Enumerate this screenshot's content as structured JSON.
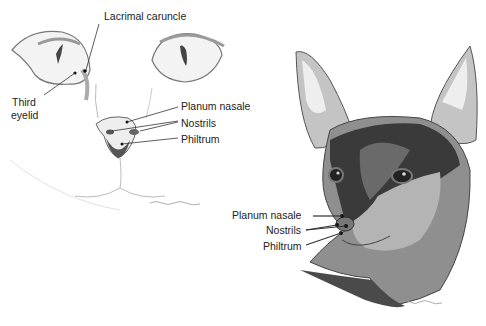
{
  "figure": {
    "cat": {
      "labels": {
        "lacrimal_caruncle": "Lacrimal caruncle",
        "third_eyelid_line1": "Third",
        "third_eyelid_line2": "eyelid",
        "planum_nasale": "Planum nasale",
        "nostrils": "Nostrils",
        "philtrum": "Philtrum"
      }
    },
    "dog": {
      "labels": {
        "planum_nasale": "Planum nasale",
        "nostrils": "Nostrils",
        "philtrum": "Philtrum"
      }
    },
    "colors": {
      "line": "#333333",
      "dog_dark": "#3a3a3a",
      "dog_mid": "#8f8f8f",
      "dog_light": "#c4c4c4"
    }
  }
}
